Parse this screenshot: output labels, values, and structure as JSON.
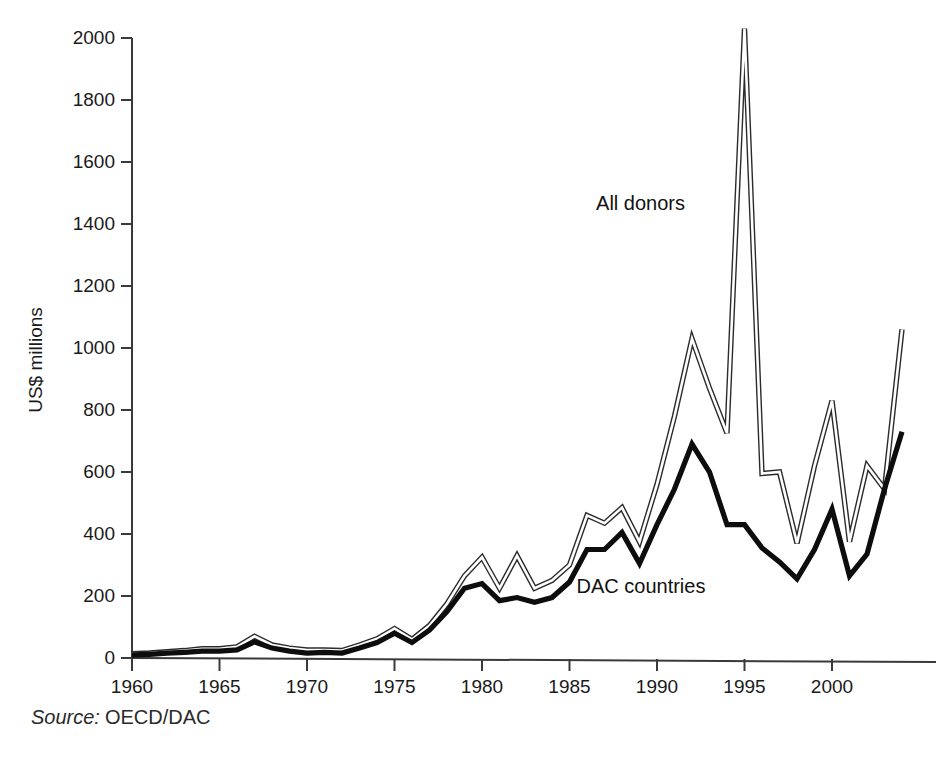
{
  "figure": {
    "name": "aid-flows-line-chart",
    "source_note": {
      "label": "Source:",
      "value": "OECD/DAC"
    },
    "series_labels": {
      "all_donors": "All donors",
      "dac_countries": "DAC countries"
    }
  },
  "chart_data": {
    "type": "line",
    "title": "",
    "subtitle": "",
    "xlabel": "",
    "ylabel": "US$ millions",
    "xlim": [
      1960,
      2004
    ],
    "ylim": [
      0,
      2000
    ],
    "grid": false,
    "legend_position": "inline-annotations",
    "x": [
      1960,
      1961,
      1962,
      1963,
      1964,
      1965,
      1966,
      1967,
      1968,
      1969,
      1970,
      1971,
      1972,
      1973,
      1974,
      1975,
      1976,
      1977,
      1978,
      1979,
      1980,
      1981,
      1982,
      1983,
      1984,
      1985,
      1986,
      1987,
      1988,
      1989,
      1990,
      1991,
      1992,
      1993,
      1994,
      1995,
      1996,
      1997,
      1998,
      1999,
      2000,
      2001,
      2002,
      2003,
      2004
    ],
    "xticks": [
      1960,
      1965,
      1970,
      1975,
      1980,
      1985,
      1990,
      1995,
      2000
    ],
    "xticklabels": [
      "1960",
      "1965",
      "1970",
      "1975",
      "1980",
      "1985",
      "1990",
      "1995",
      "2000"
    ],
    "yticks": [
      0,
      200,
      400,
      600,
      800,
      1000,
      1200,
      1400,
      1600,
      1800,
      2000
    ],
    "yticklabels": [
      "0",
      "200",
      "400",
      "600",
      "800",
      "1000",
      "1200",
      "1400",
      "1600",
      "1800",
      "2000"
    ],
    "series": [
      {
        "name": "All donors",
        "style": "outlined-thin-line",
        "color": "#2b2b2b",
        "values": [
          14,
          16,
          20,
          24,
          30,
          30,
          36,
          70,
          42,
          32,
          26,
          26,
          24,
          42,
          62,
          95,
          60,
          105,
          175,
          265,
          325,
          225,
          330,
          225,
          250,
          300,
          460,
          435,
          485,
          375,
          560,
          780,
          1030,
          870,
          725,
          2030,
          595,
          600,
          370,
          620,
          830,
          375,
          620,
          545,
          1060
        ]
      },
      {
        "name": "DAC countries",
        "style": "thick-solid-line",
        "color": "#0d0d0d",
        "values": [
          10,
          12,
          16,
          18,
          22,
          22,
          26,
          52,
          32,
          22,
          16,
          18,
          16,
          32,
          50,
          80,
          50,
          90,
          150,
          225,
          240,
          185,
          195,
          180,
          195,
          245,
          350,
          350,
          405,
          305,
          430,
          545,
          690,
          600,
          430,
          430,
          355,
          310,
          255,
          350,
          480,
          265,
          335,
          545,
          730
        ]
      }
    ],
    "annotations": [
      {
        "text": "All donors",
        "x": 1991.6,
        "y": 1445,
        "anchor": "end"
      },
      {
        "text": "DAC countries",
        "x": 1985.4,
        "y": 210,
        "anchor": "start"
      }
    ]
  }
}
